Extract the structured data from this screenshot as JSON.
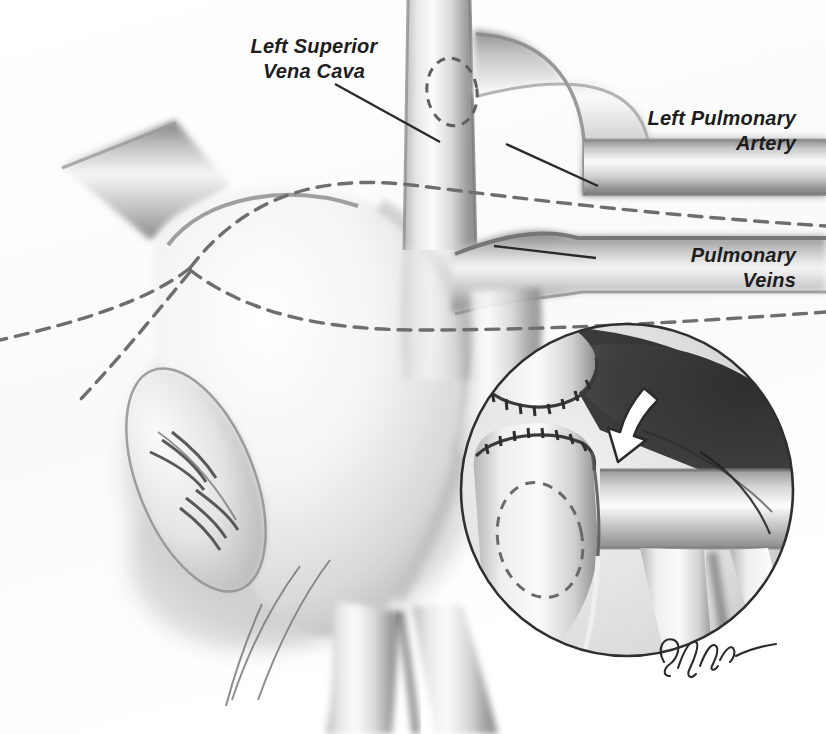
{
  "figure": {
    "kind": "medical-illustration",
    "style": "grayscale airbrush line drawing on white paper",
    "width": 826,
    "height": 734,
    "background_color": "#fdfdfd",
    "ink_color": "#1d1d1d"
  },
  "labels": [
    {
      "id": "lsvc",
      "text": "Left Superior\nVena Cava",
      "align": "center",
      "leader": {
        "from_x": 335,
        "from_y": 84,
        "to_x": 440,
        "to_y": 142
      }
    },
    {
      "id": "lpa",
      "text": "Left Pulmonary\nArtery",
      "align": "right",
      "leader": {
        "from_x": 598,
        "from_y": 186,
        "to_x": 506,
        "to_y": 144
      }
    },
    {
      "id": "pv",
      "text": "Pulmonary\nVeins",
      "align": "right",
      "leader": {
        "from_x": 596,
        "from_y": 258,
        "to_x": 494,
        "to_y": 246
      }
    }
  ],
  "signature": {
    "text": "Glynn",
    "description": "artist cursive signature at lower right of inset circle",
    "x": 688,
    "y": 652
  },
  "inset": {
    "shape": "circle",
    "center_x": 627,
    "center_y": 490,
    "radius": 167,
    "border_color": "#2a2a2a",
    "dark_field_color": "#3c3c3c",
    "contents": [
      "upper cut vessel stump with suture hatch line",
      "lower cut vessel stump with suture hatch line",
      "dashed ellipse marking planned opening",
      "white curved directional arrow",
      "horizontal vessel crossing behind",
      "bifurcating vessel at lower right"
    ]
  },
  "annotations": {
    "dashed_incision_lines": [
      {
        "id": "upper-resection-guide",
        "description": "long dashed curve running from left edge to right across atrial dome"
      },
      {
        "id": "lower-resection-guide",
        "description": "long dashed curve running from left edge rightwards below the first"
      }
    ],
    "dashed_ellipse_lsvc": {
      "cx": 452,
      "cy": 92,
      "rx": 24,
      "ry": 33,
      "description": "planned anastomosis site on left superior vena cava"
    },
    "arrow": {
      "color": "#ffffff",
      "outline": "#2b2b2b",
      "direction": "down-left",
      "description": "curved arrow showing direction of vessel transfer"
    }
  },
  "structures": [
    {
      "id": "left-superior-vena-cava",
      "description": "vertical vessel descending through upper middle of figure"
    },
    {
      "id": "left-pulmonary-artery",
      "description": "horizontal vessel crossing upper right, arching from the vena cava"
    },
    {
      "id": "pulmonary-veins",
      "description": "horizontal vessel below the artery entering the atrium"
    },
    {
      "id": "left-atrium",
      "description": "large central chamber body"
    },
    {
      "id": "atrial-appendage",
      "description": "elongated oval with radiating pectinate ridges at left"
    },
    {
      "id": "innominate-vein",
      "description": "vessel entering from upper left"
    },
    {
      "id": "inferior-bifurcation",
      "description": "vessel dividing into two branches at the bottom"
    }
  ]
}
